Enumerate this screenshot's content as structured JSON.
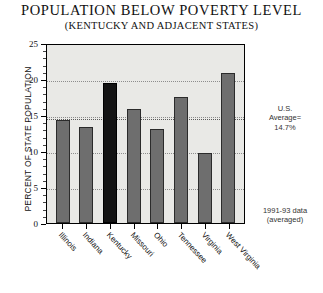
{
  "header": {
    "title": "POPULATION BELOW POVERTY LEVEL",
    "subtitle": "(KENTUCKY AND ADJACENT STATES)"
  },
  "annotations": {
    "us_average": "U.S. Average= 14.7%",
    "us_average_line1": "U.S.",
    "us_average_line2": "Average=",
    "us_average_line3": "14.7%",
    "data_note_line1": "1991-93 data",
    "data_note_line2": "(averaged)"
  },
  "colors": {
    "bar": "#6e6e6e",
    "bar_highlight": "#141414",
    "plot_background": "#e9e9e6",
    "gridline": "#8d8d8d",
    "axis": "#000000"
  },
  "chart_data": {
    "type": "bar",
    "title": "POPULATION BELOW POVERTY LEVEL",
    "subtitle": "(KENTUCKY AND ADJACENT STATES)",
    "xlabel": "",
    "ylabel": "PERCENT OF STATE POPULATION",
    "ylim": [
      0,
      25
    ],
    "yticks": [
      0,
      5,
      10,
      15,
      20,
      25
    ],
    "ytick_labels": [
      "0",
      "5",
      "10",
      "15",
      "20",
      "25"
    ],
    "grid": true,
    "grid_axis": "y",
    "legend": false,
    "categories": [
      "Illinois",
      "Indiana",
      "Kentucky",
      "Missouri",
      "Ohio",
      "Tennessee",
      "Virginia",
      "West Virginia"
    ],
    "values": [
      14.3,
      13.4,
      19.5,
      15.8,
      13.1,
      17.5,
      9.7,
      20.9
    ],
    "highlight_category": "Kentucky",
    "reference_line": {
      "label": "U.S. Average= 14.7%",
      "value": 14.7
    },
    "source_note": "1991-93 data (averaged)"
  }
}
